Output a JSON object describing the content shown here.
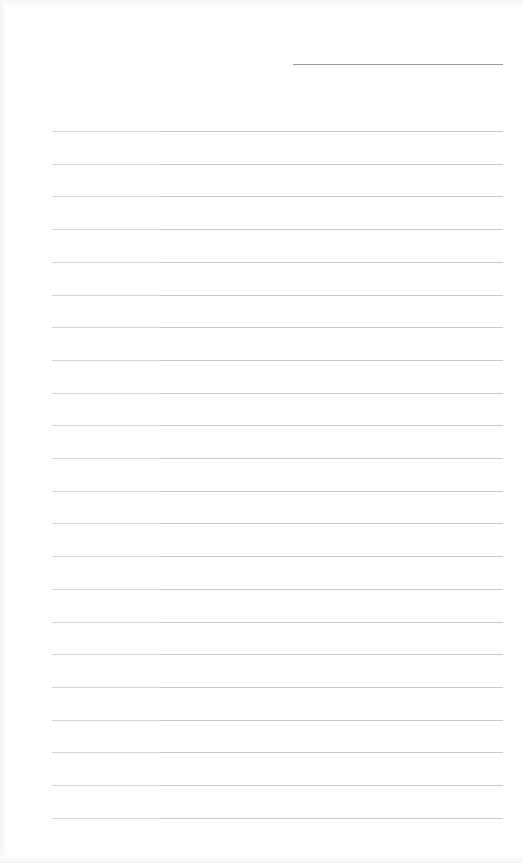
{
  "document": {
    "type": "lined-paper",
    "header_field": {
      "label": "",
      "value": ""
    },
    "ruled_lines": {
      "count": 22,
      "first_y": 131,
      "spacing": 32.7,
      "left": 52,
      "right": 503,
      "color": "#c9c9c9"
    },
    "lines": [
      "",
      "",
      "",
      "",
      "",
      "",
      "",
      "",
      "",
      "",
      "",
      "",
      "",
      "",
      "",
      "",
      "",
      "",
      "",
      "",
      "",
      ""
    ],
    "colors": {
      "paper": "#ffffff",
      "rule": "#c9c9c9",
      "header_rule": "#9a9a9a"
    }
  }
}
